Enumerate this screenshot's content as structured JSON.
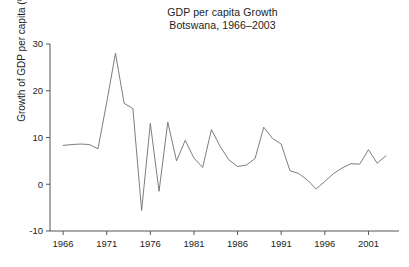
{
  "chart": {
    "title_line1": "GDP per capita Growth",
    "title_line2": "Botswana, 1966–2003",
    "ylabel": "Growth of GDP per capita (%)",
    "line_color": "#6e6e6e",
    "axis_color": "#555555",
    "background": "#ffffff"
  },
  "chart_data": {
    "type": "line",
    "title": "GDP per capita Growth\nBotswana, 1966–2003",
    "xlabel": "",
    "ylabel": "Growth of GDP per capita (%)",
    "xlim": [
      1964.5,
      2004.5
    ],
    "ylim": [
      -10,
      30
    ],
    "xticks": [
      1966,
      1971,
      1976,
      1981,
      1986,
      1991,
      1996,
      2001
    ],
    "xtick_labels": [
      "1966",
      "1971",
      "1976",
      "1981",
      "1986",
      "1991",
      "1996",
      "2001"
    ],
    "yticks": [
      -10,
      0,
      10,
      20,
      30
    ],
    "ytick_labels": [
      "-10",
      "0",
      "10",
      "20",
      "30"
    ],
    "grid": false,
    "legend": null,
    "series": [
      {
        "name": "Growth of GDP per capita (%)",
        "color": "#6e6e6e",
        "x": [
          1966,
          1967,
          1968,
          1969,
          1970,
          1971,
          1972,
          1973,
          1974,
          1975,
          1976,
          1977,
          1978,
          1979,
          1980,
          1981,
          1982,
          1983,
          1984,
          1985,
          1986,
          1987,
          1988,
          1989,
          1990,
          1991,
          1992,
          1993,
          1994,
          1995,
          1996,
          1997,
          1998,
          1999,
          2000,
          2001,
          2002,
          2003
        ],
        "values": [
          8.3,
          8.5,
          8.6,
          8.5,
          7.6,
          17.5,
          28.0,
          17.3,
          16.2,
          -5.6,
          13.0,
          -1.5,
          13.3,
          5.0,
          9.4,
          5.6,
          3.6,
          11.7,
          8.1,
          5.2,
          3.8,
          4.1,
          5.5,
          12.2,
          9.8,
          8.6,
          2.9,
          2.3,
          0.9,
          -1.0,
          0.6,
          2.3,
          3.5,
          4.4,
          4.3,
          7.4,
          4.5,
          6.1
        ]
      }
    ]
  }
}
